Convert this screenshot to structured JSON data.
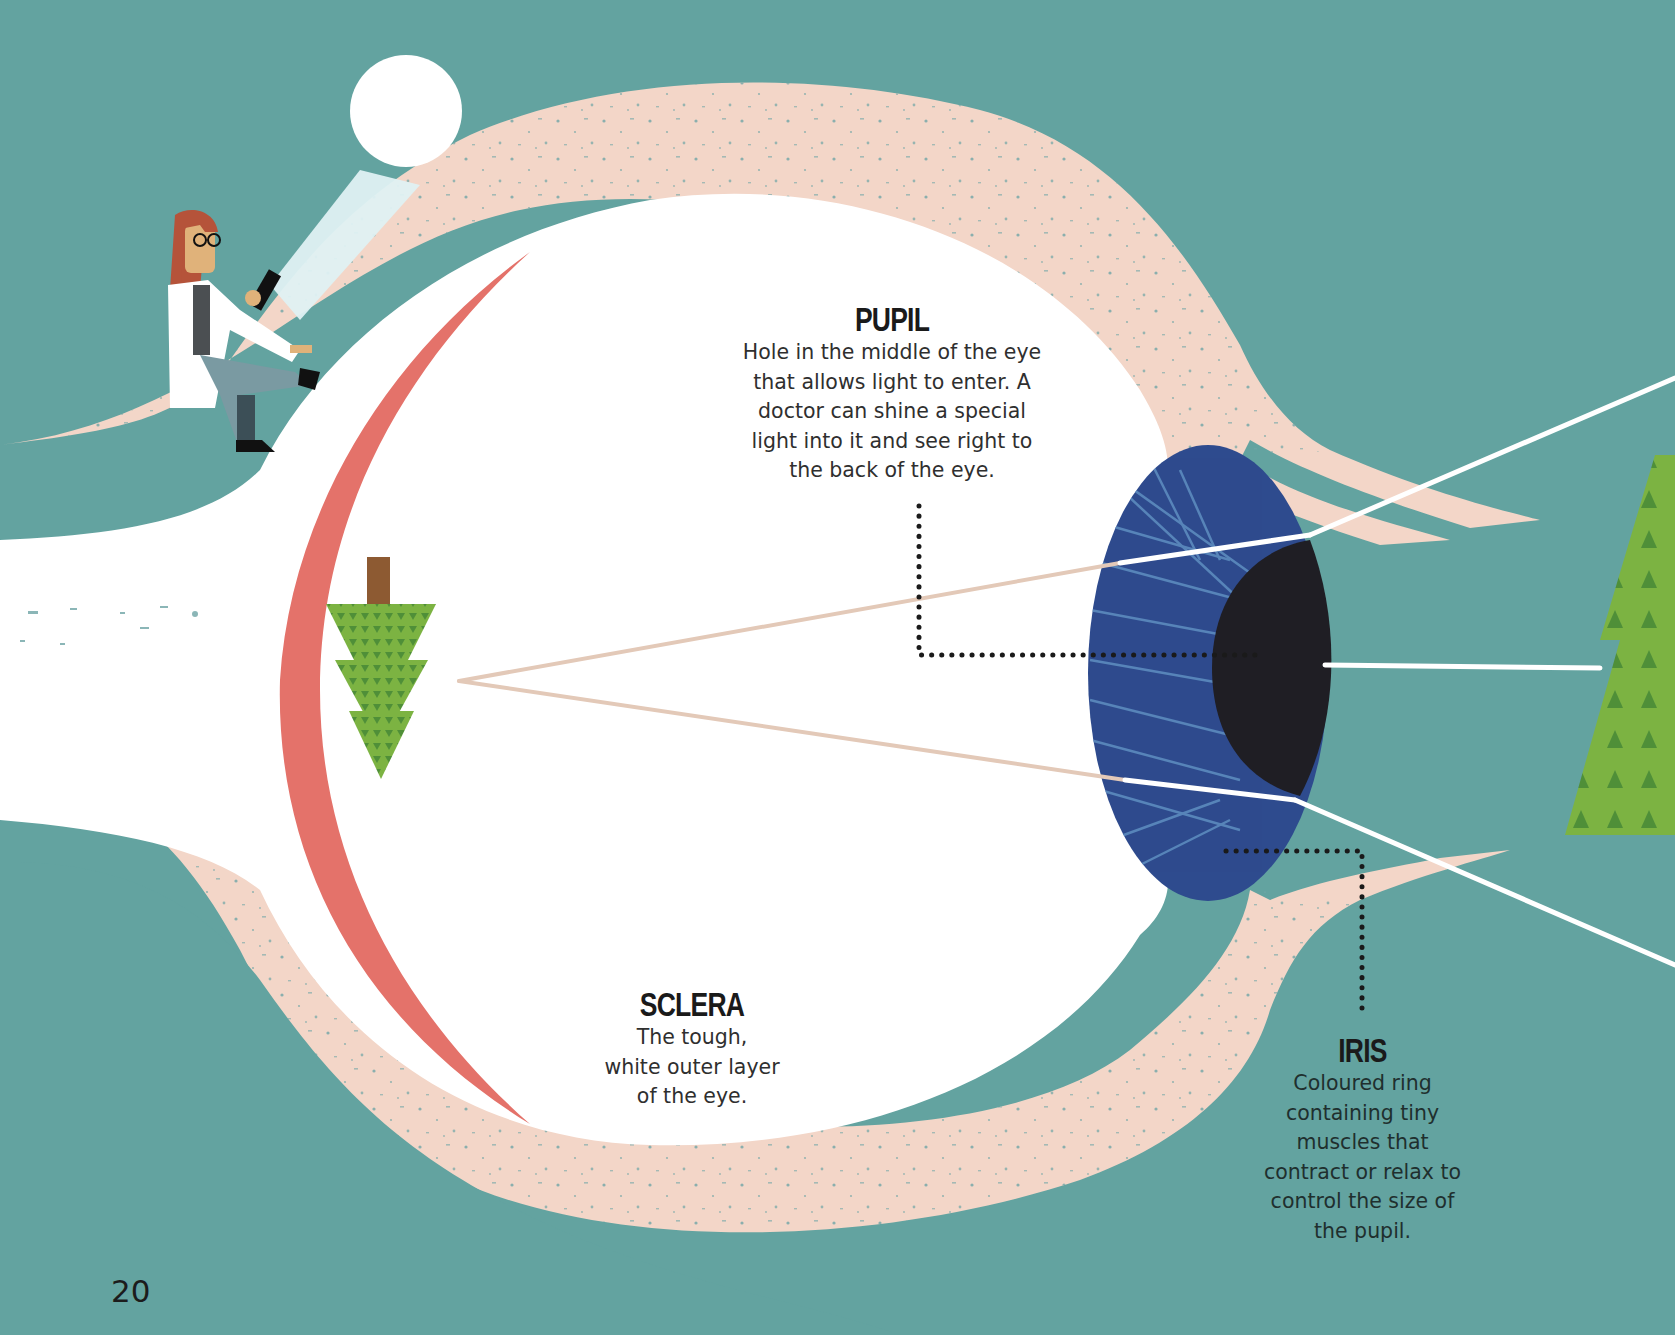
{
  "page": {
    "number": "20",
    "background_color": "#63a3a0"
  },
  "colors": {
    "background_teal": "#63a3a0",
    "eyelid_pink": "#f3d6c8",
    "sclera_white": "#ffffff",
    "lens_red": "#e4726a",
    "iris_blue": "#2e4b8e",
    "iris_streak": "#5f8fc1",
    "pupil_black": "#1f1e24",
    "tree_green": "#7cb342",
    "tree_dark": "#4f8f38",
    "trunk_brown": "#8d5a32",
    "light_ray": "#ffffff",
    "ray_inner": "#e3c9b8"
  },
  "labels": {
    "pupil": {
      "title": "PUPIL",
      "lines": [
        "Hole in the middle of the eye",
        "that allows light to enter. A",
        "doctor can shine a special",
        "light into it and see right to",
        "the back of the eye."
      ]
    },
    "sclera": {
      "title": "SCLERA",
      "lines": [
        "The tough,",
        "white outer layer",
        "of the eye."
      ]
    },
    "iris": {
      "title": "IRIS",
      "lines": [
        "Coloured ring",
        "containing tiny",
        "muscles that",
        "contract or relax to",
        "control the size of",
        "the pupil."
      ]
    }
  },
  "illustration": {
    "figures": [
      "eyeball-cross-section",
      "doctor-with-flashlight",
      "inverted-tree-image-on-retina",
      "real-tree-outside-eye",
      "light-rays"
    ]
  }
}
